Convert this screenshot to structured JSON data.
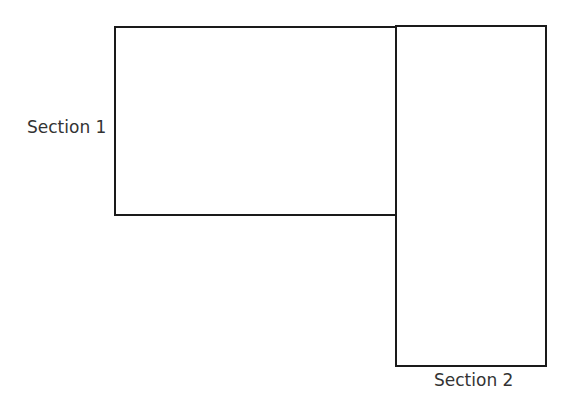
{
  "diagram": {
    "sections": [
      {
        "label": "Section 1",
        "label_position": "left"
      },
      {
        "label": "Section 2",
        "label_position": "bottom"
      }
    ],
    "colors": {
      "stroke": "#1a1a1a",
      "text": "#333333",
      "background": "#ffffff"
    }
  }
}
